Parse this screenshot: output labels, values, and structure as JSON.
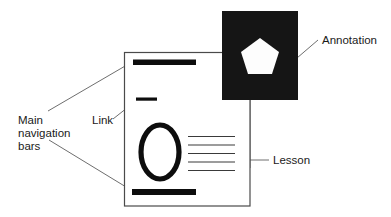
{
  "diagram": {
    "background_color": "#ffffff",
    "width": 391,
    "height": 217,
    "callouts": [
      {
        "id": "main-navigation-bars",
        "label_lines": [
          "Main",
          "navigation",
          "bars"
        ],
        "label_text": "Main navigation bars",
        "text_color": "#1a1a1a",
        "position": "left",
        "points_to": [
          "top-navigation-bar",
          "bottom-navigation-bar"
        ]
      },
      {
        "id": "link",
        "label_lines": [
          "Link"
        ],
        "label_text": "Link",
        "text_color": "#1a1a1a",
        "position": "left",
        "points_to": [
          "link-bar"
        ]
      },
      {
        "id": "annotation",
        "label_lines": [
          "Annotation"
        ],
        "label_text": "Annotation",
        "text_color": "#1a1a1a",
        "position": "top-right",
        "points_to": [
          "annotation-thumbnail"
        ]
      },
      {
        "id": "lesson",
        "label_lines": [
          "Lesson"
        ],
        "label_text": "Lesson",
        "text_color": "#1a1a1a",
        "position": "right",
        "points_to": [
          "lesson-text-lines"
        ]
      }
    ],
    "page": {
      "name": "lesson-page",
      "fill_color": "#ffffff",
      "border_color": "#4a4a4a",
      "elements": {
        "top_navigation_bar": {
          "name": "top-navigation-bar",
          "color": "#0d0d0d"
        },
        "link_bar": {
          "name": "link-bar",
          "color": "#0d0d0d"
        },
        "oval": {
          "name": "oval-graphic",
          "stroke_color": "#0d0d0d"
        },
        "text_lines": {
          "name": "lesson-text-lines",
          "count": 5,
          "color": "#3a3a3a"
        },
        "bottom_navigation_bar": {
          "name": "bottom-navigation-bar",
          "color": "#0d0d0d"
        }
      }
    },
    "annotation_thumbnail": {
      "name": "annotation-thumbnail",
      "background_color": "#151515",
      "shape": "pentagon",
      "shape_color": "#fdfdfd"
    }
  }
}
